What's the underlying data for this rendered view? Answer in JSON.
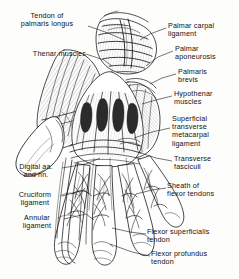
{
  "figure": {
    "background_color": "#fdfdfc",
    "ink_color": "#111111"
  },
  "labels": {
    "left": [
      {
        "id": "tendon-palmaris-longus",
        "text": "Tendon of\npalmaris longus",
        "x": 10,
        "y": 12,
        "align": "center"
      },
      {
        "id": "thenar-muscles",
        "text": "Thenar muscles",
        "x": 6,
        "y": 50,
        "align": "left"
      },
      {
        "id": "digital-aa-nn",
        "text": "Digital aa.\nand nn.",
        "x": 18,
        "y": 164,
        "align": "center"
      },
      {
        "id": "cruciform-ligament",
        "text": "Cruciform\nligament",
        "x": 18,
        "y": 192,
        "align": "center"
      },
      {
        "id": "annular-ligament",
        "text": "Annular\nligament",
        "x": 20,
        "y": 215,
        "align": "center"
      }
    ],
    "right": [
      {
        "id": "palmar-carpal-ligament",
        "text": "Palmar carpal\nligament",
        "x": 168,
        "y": 24,
        "align": "left"
      },
      {
        "id": "palmar-aponeurosis",
        "text": "Palmar\naponeurosis",
        "x": 175,
        "y": 47,
        "align": "left"
      },
      {
        "id": "palmaris-brevis",
        "text": "Palmaris\nbrevis",
        "x": 178,
        "y": 70,
        "align": "left"
      },
      {
        "id": "hypothenar-muscles",
        "text": "Hypothenar\nmuscles",
        "x": 174,
        "y": 92,
        "align": "left"
      },
      {
        "id": "superficial-transverse-metacarpal-ligament",
        "text": "Superficial\ntransverse\nmetacarpal\nligament",
        "x": 172,
        "y": 118,
        "align": "left"
      },
      {
        "id": "transverse-fasciculi",
        "text": "Transverse\nfasciculi",
        "x": 174,
        "y": 157,
        "align": "left"
      },
      {
        "id": "sheath-flexor-tendons",
        "text": "Sheath of\nflexor tendons",
        "x": 168,
        "y": 184,
        "align": "left"
      },
      {
        "id": "flexor-superficialis-tendon",
        "text": "Flexor superficialis\ntendon",
        "x": 148,
        "y": 230,
        "align": "left"
      },
      {
        "id": "flexor-profundus-tendon",
        "text": "Flexor profundus\ntendon",
        "x": 152,
        "y": 252,
        "align": "left"
      }
    ]
  },
  "leaders": {
    "palmaris_longus": "M 88,26 L 108,33 L 124,40",
    "thenar": "M 86,54 L 104,60 L 112,66",
    "digital": "M 62,168 L 86,164 L 100,158",
    "cruciform": "M 62,196 L 84,190 L 92,196",
    "annular": "M 64,219 L 86,214 L 94,220",
    "palmar_carpal": "M 166,28 L 150,34 L 140,40",
    "palmar_apo": "M 173,51 L 158,57 L 146,66",
    "palmaris_brevis": "M 176,74 L 162,78 L 150,84",
    "hypothenar": "M 172,96 L 156,100 L 142,104",
    "superficial_transverse": "M 170,128 L 152,132 L 134,138",
    "transverse_fasc": "M 172,161 L 156,158 L 138,152",
    "sheath_flexor": "M 166,188 L 152,190 L 136,194",
    "flexor_superficialis": "M 146,234 L 130,232 L 112,228",
    "flexor_profundus": "M 150,256 L 132,252 L 110,244"
  }
}
